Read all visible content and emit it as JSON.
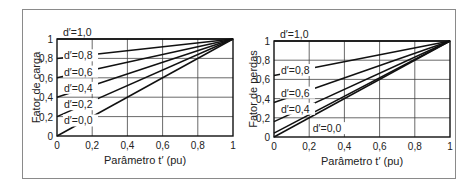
{
  "chart_data": [
    {
      "type": "line",
      "title": "",
      "xlabel": "Parâmetro t′ (pu)",
      "ylabel": "Fator de carga",
      "xlim": [
        0,
        1
      ],
      "ylim": [
        0,
        1
      ],
      "grid": true,
      "xticks": [
        "0",
        "0,2",
        "0,4",
        "0,6",
        "0,8",
        "1"
      ],
      "yticks": [
        "0",
        "0,2",
        "0,4",
        "0,6",
        "0,8",
        "1"
      ],
      "series": [
        {
          "name": "d′=1,0",
          "x": [
            0,
            1
          ],
          "y": [
            1.0,
            1.0
          ]
        },
        {
          "name": "d′=0,8",
          "x": [
            0,
            1
          ],
          "y": [
            0.8,
            1.0
          ]
        },
        {
          "name": "d′=0,6",
          "x": [
            0,
            1
          ],
          "y": [
            0.6,
            1.0
          ]
        },
        {
          "name": "d′=0,4",
          "x": [
            0,
            1
          ],
          "y": [
            0.4,
            1.0
          ]
        },
        {
          "name": "d′=0,2",
          "x": [
            0,
            1
          ],
          "y": [
            0.2,
            1.0
          ]
        },
        {
          "name": "d′=0,0",
          "x": [
            0,
            1
          ],
          "y": [
            0.0,
            1.0
          ]
        }
      ]
    },
    {
      "type": "line",
      "title": "",
      "xlabel": "Parâmetro t′ (pu)",
      "ylabel": "Fator de perdas",
      "xlim": [
        0,
        1
      ],
      "ylim": [
        0,
        1
      ],
      "grid": true,
      "xticks": [
        "0",
        "0,2",
        "0,4",
        "0,6",
        "0,8",
        "1"
      ],
      "yticks": [
        "0",
        "0,2",
        "0,4",
        "0,6",
        "0,8",
        "1"
      ],
      "series": [
        {
          "name": "d′=1,0",
          "x": [
            0,
            1
          ],
          "y": [
            1.0,
            1.0
          ]
        },
        {
          "name": "d′=0,8",
          "x": [
            0,
            1
          ],
          "y": [
            0.64,
            1.0
          ]
        },
        {
          "name": "d′=0,6",
          "x": [
            0,
            1
          ],
          "y": [
            0.36,
            1.0
          ]
        },
        {
          "name": "d′=0,4",
          "x": [
            0,
            1
          ],
          "y": [
            0.16,
            1.0
          ]
        },
        {
          "name": "d′=0,2",
          "x": [
            0,
            1
          ],
          "y": [
            0.04,
            1.0
          ]
        },
        {
          "name": "d′=0,0",
          "x": [
            0,
            1
          ],
          "y": [
            0.0,
            1.0
          ]
        }
      ]
    }
  ],
  "labels": {
    "left": [
      "d′=1,0",
      "d′=0,8",
      "d′=0,6",
      "d′=0,4",
      "d′=0,2",
      "d′=0,0"
    ],
    "right": [
      "d′=1,0",
      "d′=0,8",
      "d′=0,6",
      "d′=0,4",
      "d′=0,0"
    ]
  }
}
